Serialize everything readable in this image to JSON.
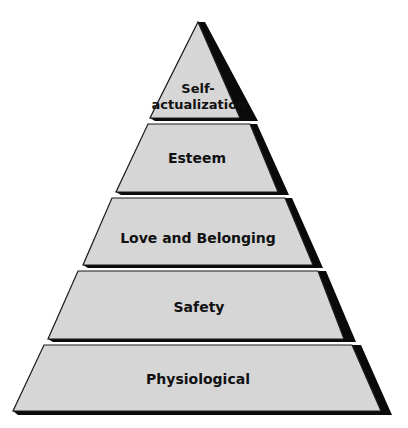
{
  "diagram": {
    "type": "pyramid",
    "title": "",
    "colors": {
      "fill": "#d6d6d6",
      "outline": "#1a1a1a",
      "shadow": "#0a0a0a",
      "text": "#111111",
      "background": "#ffffff"
    },
    "levels": [
      {
        "order": 5,
        "label_line1": "Self-",
        "label_line2": "actualization"
      },
      {
        "order": 4,
        "label": "Esteem"
      },
      {
        "order": 3,
        "label": "Love and Belonging"
      },
      {
        "order": 2,
        "label": "Safety"
      },
      {
        "order": 1,
        "label": "Physiological"
      }
    ]
  }
}
